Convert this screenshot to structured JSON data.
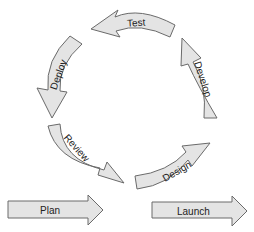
{
  "diagram": {
    "type": "cycle",
    "colors": {
      "arrow_fill": "#e4e4e4",
      "arrow_stroke": "#6a6a6a",
      "text": "#222222",
      "background": "#ffffff"
    },
    "cycle_steps": [
      {
        "id": "review",
        "label": "Review"
      },
      {
        "id": "design",
        "label": "Design"
      },
      {
        "id": "develop",
        "label": "Develop"
      },
      {
        "id": "test",
        "label": "Test"
      },
      {
        "id": "deploy",
        "label": "Deploy"
      }
    ],
    "entry": {
      "id": "plan",
      "label": "Plan"
    },
    "exit": {
      "id": "launch",
      "label": "Launch"
    }
  }
}
